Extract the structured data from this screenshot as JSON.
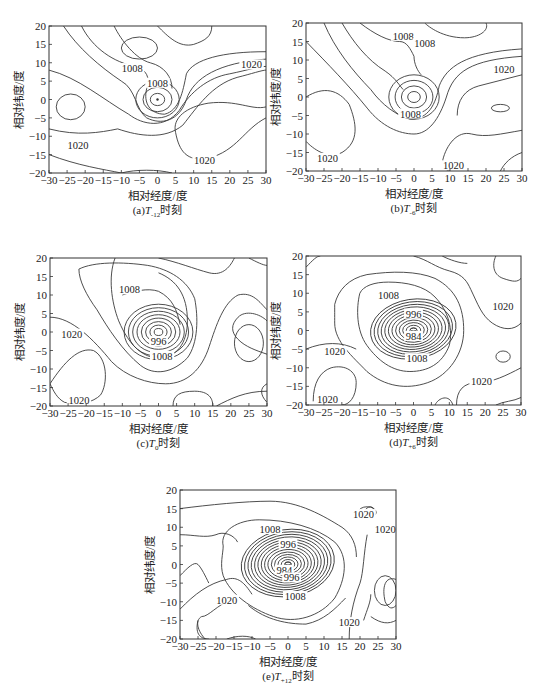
{
  "figure": {
    "x_axis_label": "相对经度/度",
    "y_axis_label": "相对纬度/度",
    "x_ticks": [
      -30,
      -25,
      -20,
      -15,
      -10,
      -5,
      0,
      5,
      10,
      15,
      20,
      25,
      30
    ],
    "y_ticks": [
      20,
      15,
      10,
      5,
      0,
      -5,
      -10,
      -15,
      -20
    ]
  },
  "panels": [
    {
      "id": "a",
      "caption_prefix": "(a)",
      "caption_T": "T",
      "caption_sub": "-12",
      "caption_suffix": "时刻",
      "frame": [
        49,
        26,
        266,
        173
      ]
    },
    {
      "id": "b",
      "caption_prefix": "(b)",
      "caption_T": "T",
      "caption_sub": "-6",
      "caption_suffix": "时刻",
      "frame": [
        306,
        23,
        522,
        171
      ]
    },
    {
      "id": "c",
      "caption_prefix": "(c)",
      "caption_T": "T",
      "caption_sub": "0",
      "caption_suffix": "时刻",
      "frame": [
        50,
        258,
        267,
        406
      ]
    },
    {
      "id": "d",
      "caption_prefix": "(d)",
      "caption_T": "T",
      "caption_sub": "+6",
      "caption_suffix": "时刻",
      "frame": [
        306,
        256,
        521,
        405
      ]
    },
    {
      "id": "e",
      "caption_prefix": "(e)",
      "caption_T": "T",
      "caption_sub": "+12",
      "caption_suffix": "时刻",
      "frame": [
        180,
        490,
        396,
        639
      ]
    }
  ],
  "chart_data": [
    {
      "type": "contour",
      "title": "(a)T-12时刻",
      "xlabel": "相对经度/度",
      "ylabel": "相对纬度/度",
      "xlim": [
        -30,
        30
      ],
      "ylim": [
        -20,
        20
      ],
      "contour_interval_hPa": 4,
      "labeled_contours": [
        {
          "value": 1008,
          "x": -7,
          "y": 8
        },
        {
          "value": 1008,
          "x": 0,
          "y": 4
        },
        {
          "value": 1020,
          "x": -22,
          "y": -13
        },
        {
          "value": 1020,
          "x": 26,
          "y": 9
        },
        {
          "value": 1020,
          "x": 13,
          "y": -17
        }
      ],
      "low_center": {
        "x": 0,
        "y": 0
      },
      "center_rings": 3,
      "secondary_features": [
        {
          "kind": "closed",
          "x": -5,
          "y": 14,
          "rx": 5,
          "ry": 3
        },
        {
          "kind": "closed_high",
          "x": -24,
          "y": -2,
          "rx": 4,
          "ry": 3.5
        }
      ]
    },
    {
      "type": "contour",
      "title": "(b)T-6时刻",
      "xlabel": "相对经度/度",
      "ylabel": "相对纬度/度",
      "xlim": [
        -30,
        30
      ],
      "ylim": [
        -20,
        20
      ],
      "contour_interval_hPa": 4,
      "labeled_contours": [
        {
          "value": 1008,
          "x": -3,
          "y": 16
        },
        {
          "value": 1008,
          "x": 3,
          "y": 14
        },
        {
          "value": 1008,
          "x": -1,
          "y": -5
        },
        {
          "value": 1020,
          "x": 25,
          "y": 7
        },
        {
          "value": 1020,
          "x": -24,
          "y": -17
        },
        {
          "value": 1020,
          "x": 11,
          "y": -19
        }
      ],
      "low_center": {
        "x": 0,
        "y": 0
      },
      "center_rings": 4,
      "secondary_features": [
        {
          "kind": "closed_high",
          "x": 24,
          "y": -3,
          "rx": 2.5,
          "ry": 1
        }
      ]
    },
    {
      "type": "contour",
      "title": "(c)T0时刻",
      "xlabel": "相对经度/度",
      "ylabel": "相对纬度/度",
      "xlim": [
        -30,
        30
      ],
      "ylim": [
        -20,
        20
      ],
      "contour_interval_hPa": 4,
      "labeled_contours": [
        {
          "value": 1008,
          "x": -8,
          "y": 11
        },
        {
          "value": 996,
          "x": 0,
          "y": -3
        },
        {
          "value": 1008,
          "x": 1,
          "y": -7
        },
        {
          "value": 1020,
          "x": -24,
          "y": -1
        },
        {
          "value": 1020,
          "x": -22,
          "y": -19
        }
      ],
      "low_center": {
        "x": 0,
        "y": 0
      },
      "center_rings": 8,
      "secondary_features": [
        {
          "kind": "closed_high",
          "x": 25,
          "y": -3,
          "rx": 4,
          "ry": 5
        }
      ]
    },
    {
      "type": "contour",
      "title": "(d)T+6时刻",
      "xlabel": "相对经度/度",
      "ylabel": "相对纬度/度",
      "xlim": [
        -30,
        30
      ],
      "ylim": [
        -20,
        20
      ],
      "contour_interval_hPa": 4,
      "labeled_contours": [
        {
          "value": 1008,
          "x": -7,
          "y": 9
        },
        {
          "value": 996,
          "x": 0,
          "y": 4
        },
        {
          "value": 984,
          "x": 0,
          "y": -2
        },
        {
          "value": 1008,
          "x": 1,
          "y": -8
        },
        {
          "value": 1020,
          "x": 25,
          "y": 6
        },
        {
          "value": 1020,
          "x": -22,
          "y": -6
        },
        {
          "value": 1020,
          "x": 19,
          "y": -14
        },
        {
          "value": 1020,
          "x": -24,
          "y": -19
        }
      ],
      "low_center": {
        "x": 0,
        "y": 0
      },
      "center_rings": 12,
      "secondary_features": [
        {
          "kind": "closed_high",
          "x": 25,
          "y": -7,
          "rx": 2,
          "ry": 1.5
        }
      ]
    },
    {
      "type": "contour",
      "title": "(e)T+12时刻",
      "xlabel": "相对经度/度",
      "ylabel": "相对纬度/度",
      "xlim": [
        -30,
        30
      ],
      "ylim": [
        -20,
        20
      ],
      "contour_interval_hPa": 4,
      "labeled_contours": [
        {
          "value": 1008,
          "x": -5,
          "y": 9
        },
        {
          "value": 996,
          "x": 0,
          "y": 5
        },
        {
          "value": 984,
          "x": -1,
          "y": -2
        },
        {
          "value": 996,
          "x": 1,
          "y": -4
        },
        {
          "value": 1008,
          "x": 2,
          "y": -9
        },
        {
          "value": 1020,
          "x": -17,
          "y": -10
        },
        {
          "value": 1020,
          "x": 21,
          "y": 13
        },
        {
          "value": 1020,
          "x": 27,
          "y": 9
        },
        {
          "value": 1020,
          "x": 17,
          "y": -16
        }
      ],
      "low_center": {
        "x": 0,
        "y": 0
      },
      "center_rings": 14,
      "secondary_features": [
        {
          "kind": "closed",
          "x": 22,
          "y": 14,
          "rx": 2.5,
          "ry": 1.5
        },
        {
          "kind": "closed_high",
          "x": 27,
          "y": -7,
          "rx": 3,
          "ry": 4
        }
      ]
    }
  ]
}
